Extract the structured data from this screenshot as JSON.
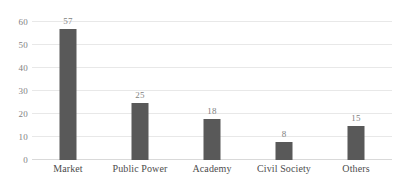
{
  "chart_data": {
    "type": "bar",
    "title": "",
    "subtitle": "",
    "xlabel": "",
    "ylabel": "",
    "categories": [
      "Market",
      "Public Power",
      "Academy",
      "Civil Society",
      "Others"
    ],
    "values": [
      57,
      25,
      18,
      8,
      15
    ],
    "data_labels": [
      "57",
      "25",
      "18",
      "8",
      "15"
    ],
    "ylim": [
      0,
      60
    ],
    "yticks": [
      0,
      10,
      20,
      30,
      40,
      50,
      60
    ],
    "ytick_labels": [
      "0",
      "10",
      "20",
      "30",
      "40",
      "50",
      "60"
    ],
    "grid": true,
    "grid_axis": "y",
    "legend": false,
    "legend_position": "none",
    "bar_color": "#595959",
    "grid_color": "#e8e8e8",
    "axis_color": "#d9d9d9",
    "label_color": "#4d4d4d",
    "tick_color": "#7f7f7f",
    "background_color": "#ffffff"
  }
}
